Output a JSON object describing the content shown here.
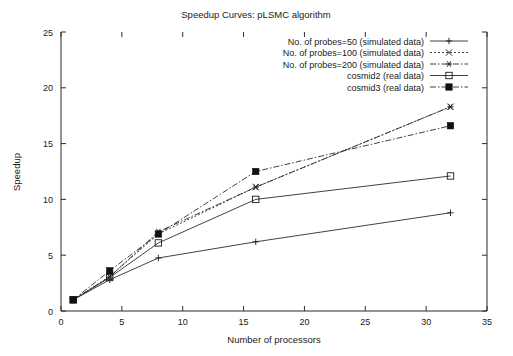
{
  "chart_data": {
    "type": "line",
    "title": "Speedup Curves: pLSMC algorithm",
    "xlabel": "Number of processors",
    "ylabel": "Speedup",
    "xlim": [
      0,
      35
    ],
    "ylim": [
      0,
      25
    ],
    "xticks": [
      "0",
      "5",
      "10",
      "15",
      "20",
      "25",
      "30",
      "35"
    ],
    "xtick_values": [
      0,
      5,
      10,
      15,
      20,
      25,
      30,
      35
    ],
    "yticks": [
      "0",
      "5",
      "10",
      "15",
      "20",
      "25"
    ],
    "ytick_values": [
      0,
      5,
      10,
      15,
      20,
      25
    ],
    "grid": false,
    "legend_position": "top-right",
    "legend_border": false,
    "x": [
      1,
      4,
      8,
      16,
      32
    ],
    "series": [
      {
        "name": "No. of probes=50 (simulated data)",
        "marker": "plus",
        "linestyle": "solid",
        "values": [
          1.0,
          2.8,
          4.75,
          6.2,
          8.8
        ]
      },
      {
        "name": "No. of probes=100 (simulated data)",
        "marker": "cross",
        "linestyle": "dotted",
        "values": [
          1.0,
          3.1,
          6.9,
          11.1,
          18.3
        ]
      },
      {
        "name": "No. of probes=200 (simulated data)",
        "marker": "star",
        "linestyle": "dash-dot",
        "values": [
          1.0,
          3.05,
          7.1,
          11.1,
          18.3
        ]
      },
      {
        "name": "cosmid2 (real data)",
        "marker": "open-square",
        "linestyle": "solid",
        "values": [
          1.0,
          3.0,
          6.1,
          10.0,
          12.1
        ]
      },
      {
        "name": "cosmid3 (real data)",
        "marker": "filled-square",
        "linestyle": "dash-dot",
        "values": [
          1.0,
          3.6,
          6.9,
          12.5,
          16.6
        ]
      }
    ],
    "colors": {
      "axis": "#2b2b2b",
      "series": "#1a1a1a",
      "background": "#ffffff"
    }
  }
}
